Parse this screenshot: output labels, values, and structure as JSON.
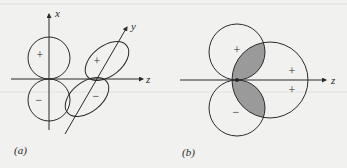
{
  "figure": {
    "panel_a": {
      "caption": "(a)",
      "axes": {
        "x": "x",
        "y": "y",
        "z": "z"
      },
      "lobes": [
        {
          "id": "pz-upper",
          "sign": "+"
        },
        {
          "id": "pz-lower",
          "sign": "−"
        },
        {
          "id": "tilted-upper",
          "sign": "+"
        },
        {
          "id": "tilted-lower",
          "sign": "−"
        }
      ]
    },
    "panel_b": {
      "caption": "(b)",
      "axes": {
        "z": "z"
      },
      "lobes": [
        {
          "id": "small-upper",
          "sign": "+"
        },
        {
          "id": "small-lower",
          "sign": "−"
        },
        {
          "id": "large-upper-sign",
          "sign": "+"
        },
        {
          "id": "large-lower-sign",
          "sign": "+"
        }
      ],
      "shaded_overlap": true
    },
    "colors": {
      "line": "#2a2a2a",
      "shade": "#9a9a9a",
      "background": "#f1f1ef"
    }
  }
}
